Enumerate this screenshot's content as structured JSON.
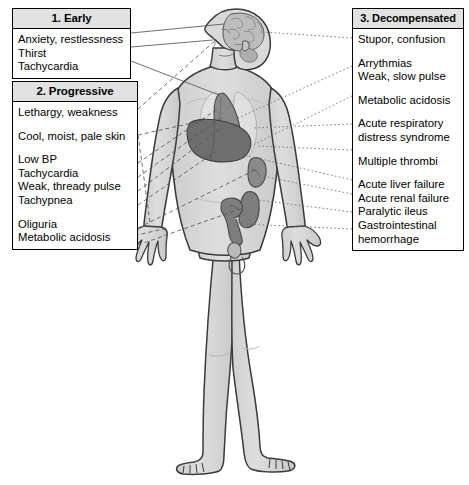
{
  "diagram": {
    "colors": {
      "outline": "#3a3a3a",
      "body_fill": "#d6d6d6",
      "body_fill_light": "#e4e4e4",
      "brain": "#bdbdbd",
      "heart": "#8a8a8a",
      "lung": "#c9c9c9",
      "liver": "#6e6e6e",
      "kidney": "#8a8a8a",
      "intestine": "#7d7d7d",
      "bladder": "#d0d0d0",
      "box_border": "#000000",
      "box_header_bg": "#e2e2e2",
      "leader_line": "#555555"
    }
  },
  "stages": [
    {
      "id": "early",
      "header": "1. Early",
      "symptoms": [
        {
          "text": "Anxiety, restlessness",
          "gap": false
        },
        {
          "text": "Thirst",
          "gap": false
        },
        {
          "text": "Tachycardia",
          "gap": false
        }
      ]
    },
    {
      "id": "progressive",
      "header": "2. Progressive",
      "symptoms": [
        {
          "text": "Lethargy, weakness",
          "gap": false
        },
        {
          "text": "Cool, moist, pale skin",
          "gap": true
        },
        {
          "text": "Low BP",
          "gap": true
        },
        {
          "text": "Tachycardia",
          "gap": false
        },
        {
          "text": "Weak, thready pulse",
          "gap": false
        },
        {
          "text": "Tachypnea",
          "gap": false
        },
        {
          "text": "Oliguria",
          "gap": true
        },
        {
          "text": "Metabolic acidosis",
          "gap": false
        }
      ]
    },
    {
      "id": "decompensated",
      "header": "3. Decompensated",
      "symptoms": [
        {
          "text": "Stupor, confusion",
          "gap": false
        },
        {
          "text": "Arrythmias",
          "gap": true
        },
        {
          "text": "Weak, slow pulse",
          "gap": false
        },
        {
          "text": "Metabolic acidosis",
          "gap": true
        },
        {
          "text": "Acute respiratory",
          "gap": true
        },
        {
          "text": "distress syndrome",
          "gap": false
        },
        {
          "text": "Multiple thrombi",
          "gap": true
        },
        {
          "text": "Acute liver failure",
          "gap": true
        },
        {
          "text": "Acute renal failure",
          "gap": false
        },
        {
          "text": "Paralytic ileus",
          "gap": false
        },
        {
          "text": "Gastrointestinal",
          "gap": false
        },
        {
          "text": "hemorrhage",
          "gap": false
        }
      ]
    }
  ],
  "anatomy": {
    "organs": [
      {
        "name": "brain",
        "label": "brain"
      },
      {
        "name": "heart",
        "label": "heart"
      },
      {
        "name": "lungs",
        "label": "lungs"
      },
      {
        "name": "liver",
        "label": "liver"
      },
      {
        "name": "kidney",
        "label": "kidney"
      },
      {
        "name": "intestines",
        "label": "intestines"
      },
      {
        "name": "bladder",
        "label": "bladder"
      }
    ]
  }
}
